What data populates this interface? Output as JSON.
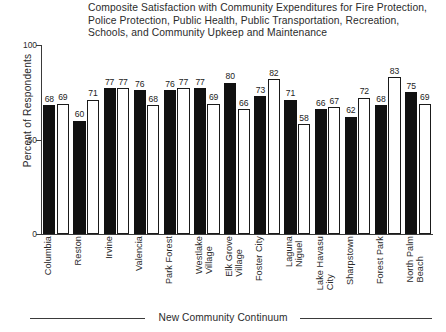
{
  "chart_data": {
    "type": "bar",
    "title": "Composite Satisfaction with Community Expenditures for Fire Protection, Police Protection, Public Health, Public Transportation, Recreation, Schools, and Community Upkeep and Maintenance",
    "xlabel": "New Community Continuum",
    "ylabel": "Percent of Respondents",
    "ylim": [
      0,
      100
    ],
    "yticks": [
      0,
      50,
      100
    ],
    "ytick_labels": [
      "0",
      "50",
      "100"
    ],
    "grid": false,
    "legend": "none",
    "categories": [
      "Columbia",
      "Reston",
      "Irvine",
      "Valencia",
      "Park Forest",
      "Westlake Village",
      "Elk Grove Village",
      "Foster City",
      "Laguna Niguel",
      "Lake Havasu City",
      "Sharpstown",
      "Forest Park",
      "North Palm Beach"
    ],
    "series": [
      {
        "name": "dark-bar",
        "fill": "#111111",
        "values": [
          68,
          60,
          77,
          76,
          76,
          77,
          80,
          73,
          71,
          66,
          62,
          68,
          75
        ]
      },
      {
        "name": "light-bar",
        "fill": "#ffffff",
        "values": [
          69,
          71,
          77,
          68,
          77,
          69,
          66,
          82,
          58,
          67,
          72,
          83,
          69
        ]
      }
    ]
  },
  "axis": {
    "caption": "New Community Continuum"
  },
  "labels_multiline": [
    "Columbia",
    "Reston",
    "Irvine",
    "Valencia",
    "Park Forest",
    "Westlake\nVillage",
    "Elk Grove\nVillage",
    "Foster City",
    "Laguna\nNiguel",
    "Lake Havasu\nCity",
    "Sharpstown",
    "Forest Park",
    "North Palm\nBeach"
  ]
}
